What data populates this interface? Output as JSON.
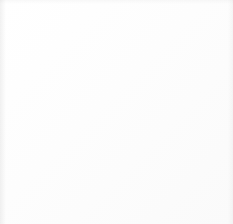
{
  "document": {
    "kind": "graph-paper-drawing",
    "title": "Interlocking circle tessellation on graph paper",
    "alt_text": "Hand-drawn tessellation of interlocking circular arcs forming S-curves across a square grid, enclosed in a dark ruled border"
  },
  "canvas": {
    "width": 233,
    "height": 224,
    "background_color": "#ffffff"
  },
  "border": {
    "name": "ruled-frame",
    "color": "#2e2e2e",
    "stroke_width": 2.2,
    "x": 8,
    "y": 6,
    "width": 220,
    "height": 216
  },
  "grid": {
    "name": "graph-paper-grid",
    "color": "#dedede",
    "stroke_width": 0.8,
    "spacing": 14.6,
    "origin_x": 8,
    "origin_y": 6,
    "columns": 15,
    "rows": 15,
    "visible": true
  },
  "pattern": {
    "name": "circle-tessellation",
    "description": "Grid of overlapping circles of equal radius whose arcs interlock into continuous S-curves",
    "circle_radius": 29,
    "lattice_spacing_x": 41,
    "lattice_spacing_y": 41,
    "lattice_rotation_deg": 0,
    "stroke_dark": "#3c3c3c",
    "stroke_light": "#9a9a9a",
    "stroke_width_dark": 1.7,
    "stroke_width_light": 1.3,
    "circle_centers": [
      [
        22,
        24
      ],
      [
        63,
        24
      ],
      [
        104,
        24
      ],
      [
        145,
        24
      ],
      [
        186,
        24
      ],
      [
        227,
        24
      ],
      [
        2,
        65
      ],
      [
        43,
        65
      ],
      [
        84,
        65
      ],
      [
        125,
        65
      ],
      [
        166,
        65
      ],
      [
        207,
        65
      ],
      [
        22,
        106
      ],
      [
        63,
        106
      ],
      [
        104,
        106
      ],
      [
        145,
        106
      ],
      [
        186,
        106
      ],
      [
        227,
        106
      ],
      [
        2,
        147
      ],
      [
        43,
        147
      ],
      [
        84,
        147
      ],
      [
        125,
        147
      ],
      [
        166,
        147
      ],
      [
        207,
        147
      ],
      [
        22,
        188
      ],
      [
        63,
        188
      ],
      [
        104,
        188
      ],
      [
        145,
        188
      ],
      [
        186,
        188
      ],
      [
        227,
        188
      ],
      [
        2,
        229
      ],
      [
        43,
        229
      ],
      [
        84,
        229
      ],
      [
        125,
        229
      ],
      [
        166,
        229
      ],
      [
        207,
        229
      ]
    ],
    "dark_circle_indices": [
      0,
      2,
      4,
      7,
      9,
      11,
      12,
      14,
      16,
      19,
      21,
      23,
      24,
      26,
      28,
      31,
      33,
      35
    ],
    "light_circle_indices": [
      1,
      3,
      5,
      6,
      8,
      10,
      13,
      15,
      17,
      18,
      20,
      22,
      25,
      27,
      29,
      30,
      32,
      34
    ]
  }
}
